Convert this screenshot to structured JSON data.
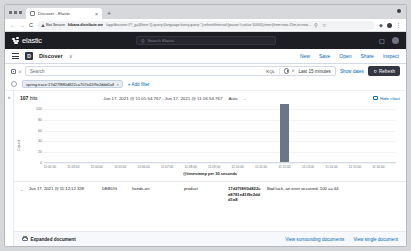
{
  "browser": {
    "tab_title": "Discover - Elastic",
    "tab_close": "×",
    "new_tab": "+",
    "back": "←",
    "forward": "→",
    "reload": "C",
    "not_secure": "Not Secure",
    "url_host": "kibana.distribute.me",
    "url_path": "/app/discover#/?_g=(filters:!(),query:(language:kuery,query:''),refreshInterval:(pause:!t,value:10000),time:(from:now-15m,to:now...",
    "bookmark": "☆",
    "extensions_icon": "extensions-icon",
    "profile_icon": "profile-icon",
    "menu_icon": "⋮"
  },
  "kibana_header": {
    "brand": "elastic",
    "search_placeholder": "Search Elastic",
    "news_icon": "news-icon",
    "account_icon": "account-avatar"
  },
  "appnav": {
    "menu_icon": "hamburger-menu",
    "app_letter": "D",
    "title": "Discover",
    "chevron": "∨",
    "actions": [
      "New",
      "Save",
      "Open",
      "Share",
      "Inspect"
    ]
  },
  "querybar": {
    "dataview_icon": "dataview-icon",
    "dataview_chevron": "∨",
    "search_placeholder": "Search",
    "language": "KQL",
    "clock_chevron": "∨",
    "time_range": "Last 15 minutes",
    "show_dates": "Show dates",
    "refresh_icon": "↻",
    "refresh_label": "Refresh"
  },
  "filterbar": {
    "globe_icon": "filter-globe-icon",
    "pill_text": "spring.trace:17d27f8ff0d822ca707e41f9e2ddd1a8",
    "pill_close": "×",
    "add_filter": "+ Add filter"
  },
  "sidebar": {
    "toggle_icon": "»"
  },
  "results": {
    "hits_count": "107",
    "hits_label": "hits",
    "time_range_display": "Jun 17, 2021 @ 11:01:54.767 - Jun 17, 2021 @ 11:16:54.767",
    "interval": "Auto",
    "dash": "–",
    "hide_chart": "Hide chart",
    "hide_chart_icon": "chart-icon"
  },
  "chart_data": {
    "type": "bar",
    "title": "",
    "xlabel": "@timestamp per 30 seconds",
    "ylabel": "Count",
    "ylim": [
      0,
      100
    ],
    "yticks": [
      100,
      80,
      60,
      40,
      20,
      0
    ],
    "categories": [
      "11:02:00",
      "11:02:30",
      "11:03:00",
      "11:03:30",
      "11:04:00",
      "11:04:30",
      "11:05:00",
      "11:05:30",
      "11:06:00",
      "11:06:30",
      "11:07:00",
      "11:07:30",
      "11:08:00",
      "11:08:30",
      "11:09:00",
      "11:09:30",
      "11:10:00",
      "11:10:30",
      "11:11:00",
      "11:11:30",
      "11:12:00",
      "11:12:30",
      "11:13:00",
      "11:13:30",
      "11:14:00",
      "11:14:30",
      "11:15:00",
      "11:15:30",
      "11:16:00",
      "11:16:30"
    ],
    "values": [
      0,
      0,
      0,
      0,
      0,
      0,
      0,
      0,
      0,
      0,
      0,
      0,
      0,
      0,
      0,
      0,
      0,
      0,
      0,
      0,
      107,
      0,
      0,
      0,
      0,
      0,
      0,
      0,
      0,
      0
    ],
    "xtick_labels": [
      "11:02:00",
      "11:03:00",
      "11:04:00",
      "11:05:00",
      "11:06:00",
      "11:07:00",
      "11:08:00",
      "11:09:00",
      "11:10:00",
      "11:11:00",
      "11:12:00",
      "11:13:00",
      "11:14:00",
      "11:15:00",
      "11:16:00"
    ],
    "bar_color": "#6b7688",
    "grid": true,
    "legend": "none"
  },
  "document": {
    "caret": "⌄",
    "timestamp": "Jun 17, 2021 @ 11:12:12.328",
    "level": "DEBUG",
    "service": "hands-on",
    "component": "product",
    "trace": "17d27f8ff0d822ca8781e41f9e2ddd1a8",
    "message": "Bad luck, an error occurred, 100 == 64"
  },
  "footer": {
    "expanded_document": "Expanded document",
    "folder_icon": "folder-icon",
    "view_surrounding": "View surrounding documents",
    "view_single": "View single document"
  }
}
